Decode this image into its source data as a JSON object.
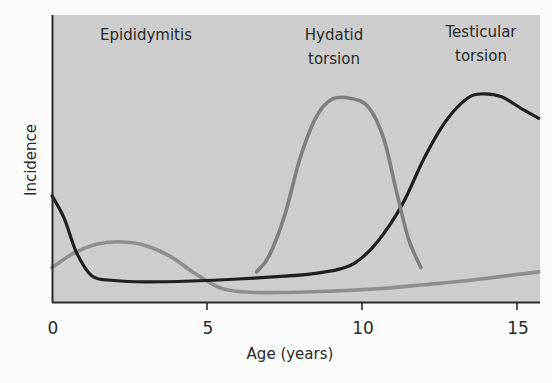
{
  "chart_data": {
    "type": "line",
    "title": "",
    "xlabel": "Age (years)",
    "ylabel": "Incidence",
    "xlim": [
      0,
      15.7
    ],
    "ylim": [
      0,
      100
    ],
    "x_ticks": [
      0,
      5,
      10,
      15
    ],
    "x_tick_labels": [
      "0",
      "5",
      "10",
      "15"
    ],
    "y_ticks": [],
    "grid": false,
    "legend": "none (direct annotations at top)",
    "background_color": "#cdcdcd",
    "annotations": [
      {
        "text": "Epididymitis",
        "series": "Epididymitis",
        "at_age": 3
      },
      {
        "text_lines": [
          "Hydatid",
          "torsion"
        ],
        "series": "Hydatid torsion",
        "at_age": 9.8
      },
      {
        "text_lines": [
          "Testicular",
          "torsion"
        ],
        "series": "Testicular torsion",
        "at_age": 14.1
      }
    ],
    "series": [
      {
        "name": "Epididymitis",
        "color": "#8e8e8e",
        "x": [
          0,
          0.7,
          1.4,
          2.1,
          2.9,
          3.8,
          4.6,
          5.4,
          6.2,
          7.5,
          9,
          10.5,
          12,
          13.5,
          15.7
        ],
        "y": [
          12,
          17,
          20,
          21,
          20,
          16,
          10,
          5,
          3.5,
          3.3,
          3.8,
          4.6,
          6,
          7.6,
          10.5
        ]
      },
      {
        "name": "Testicular torsion",
        "color": "#1f1f1f",
        "x": [
          0,
          0.4,
          0.8,
          1.3,
          2,
          3,
          4.5,
          6,
          7.5,
          8.5,
          9.2,
          9.8,
          10.5,
          11.3,
          12,
          12.7,
          13.4,
          13.9,
          14.5,
          15.2,
          15.7
        ],
        "y": [
          37,
          29,
          17,
          9,
          7.5,
          7,
          7.3,
          8,
          9,
          10,
          11.3,
          13.8,
          21,
          34,
          50,
          63,
          71,
          72.5,
          71.5,
          67,
          64
        ]
      },
      {
        "name": "Hydatid torsion",
        "color": "#7f7f7f",
        "x": [
          6.6,
          7,
          7.5,
          8,
          8.5,
          9,
          9.6,
          10.2,
          10.7,
          11.1,
          11.5,
          11.9
        ],
        "y": [
          10.5,
          16,
          30,
          50,
          64,
          70.5,
          71,
          68,
          57,
          39,
          22,
          12
        ]
      }
    ]
  }
}
